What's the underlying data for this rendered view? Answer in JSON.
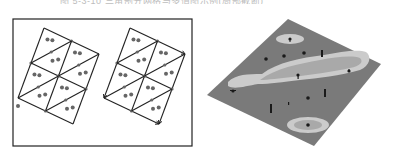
{
  "caption": {
    "text": "图 5-3-10  三角剖分网格与多值图示例(局部截断)",
    "visible": "partially cut off at top edge"
  },
  "left_figure": {
    "description": "Two rotated rectangular grids subdivided into triangles with scattered sample points and edge nodes",
    "frame": {
      "x": 13,
      "y": 19,
      "w": 179,
      "h": 127,
      "stroke": "#222222"
    },
    "line_color": "#222222",
    "point_color": "#666666",
    "grids": [
      {
        "id": "grid-a",
        "offset_x": 0,
        "corners": [
          [
            44,
            28
          ],
          [
            99,
            54
          ],
          [
            73,
            124
          ],
          [
            18,
            98
          ]
        ],
        "center": [
          59,
          76
        ],
        "arrowheads": false
      },
      {
        "id": "grid-b",
        "offset_x": 86,
        "corners": [
          [
            130,
            28
          ],
          [
            185,
            54
          ],
          [
            159,
            124
          ],
          [
            104,
            98
          ]
        ],
        "center": [
          145,
          76
        ],
        "arrowheads": true
      }
    ],
    "outlier_point": [
      18,
      106
    ]
  },
  "right_figure": {
    "description": "3D perspective surface plane with elongated contour region, two islands and scattered markers",
    "plane": {
      "points": [
        [
          88,
          19
        ],
        [
          181,
          64
        ],
        [
          114,
          146
        ],
        [
          7,
          95
        ]
      ],
      "fill": "#7a7a7a"
    },
    "main_region": {
      "outer_fill": "#c9c9c9",
      "inner_fill": "#a8a8a8"
    },
    "islands": [
      {
        "cx": 90,
        "cy": 39,
        "rx": 14,
        "ry": 5
      },
      {
        "cx": 108,
        "cy": 125,
        "rx": 21,
        "ry": 8
      }
    ],
    "marker_color": "#1a1a1a"
  }
}
